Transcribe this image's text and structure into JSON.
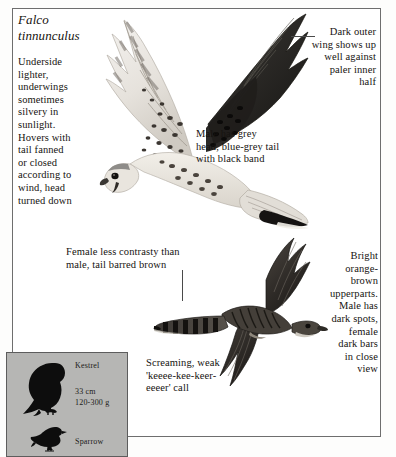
{
  "plate": {
    "species_scientific_name": "Falco\ntinnunculus",
    "common_name": "Kestrel",
    "annotations": {
      "underside": "Underside\nlighter,\nunderwings\nsometimes\nsilvery in\nsunlight.\nHovers with\ntail fanned\nor closed\naccording to\nwind, head\nturned down",
      "dark_outer_wing": "Dark outer\nwing shows up\nwell against\npaler inner\nhalf",
      "male_head_tail": "Male has grey\nhead, blue-grey tail\nwith black band",
      "female_contrast": "Female less contrasty than\nmale, tail barred brown",
      "upperparts": "Bright\norange-\nbrown\nupperparts.\nMale has\ndark spots,\nfemale\ndark bars\nin close\nview",
      "call": "Screaming, weak\n'keeee-kee-keer-\neeeer' call"
    }
  },
  "size_legend": {
    "kestrel_label": "Kestrel",
    "kestrel_size": "33 cm\n120-300 g",
    "sparrow_label": "Sparrow",
    "background_color": "#b6b6b4",
    "silhouette_color": "#0d0d0d"
  },
  "illustrations": {
    "upper_bird": "kestrel-in-flight-underside",
    "lower_bird": "kestrel-in-flight-upperside"
  },
  "colors": {
    "page_background": "#ffffff",
    "text": "#161310",
    "frame_border": "#6e6e6e",
    "leader_line": "#4a4a4a"
  }
}
